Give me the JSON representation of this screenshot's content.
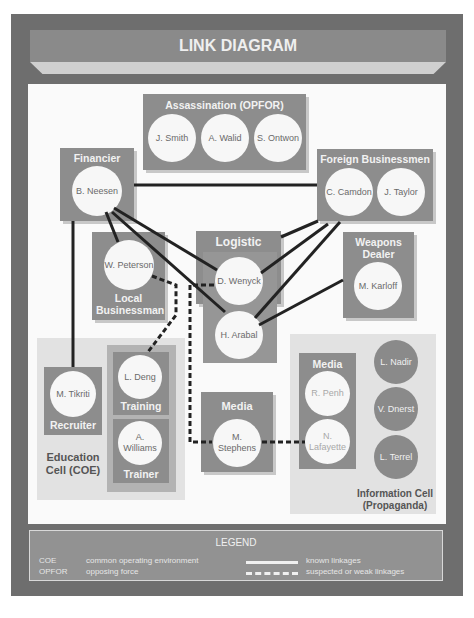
{
  "title": "LINK DIAGRAM",
  "groups": {
    "assassination": {
      "title": "Assassination (OPFOR)",
      "members": [
        "J. Smith",
        "A. Walid",
        "S. Ontwon"
      ]
    },
    "financier": {
      "title": "Financier",
      "members": [
        "B. Neesen"
      ]
    },
    "foreign_businessmen": {
      "title": "Foreign Businessmen",
      "members": [
        "C. Camdon",
        "J. Taylor"
      ]
    },
    "local_businessman": {
      "title": "Local Businessman",
      "members": [
        "W. Peterson"
      ]
    },
    "logistic": {
      "title": "Logistic",
      "members": [
        "D. Wenyck",
        "H. Arabal"
      ]
    },
    "weapons_dealer": {
      "title": "Weapons Dealer",
      "members": [
        "M. Karloff"
      ]
    },
    "recruiter": {
      "title": "Recruiter",
      "members": [
        "M. Tikriti"
      ]
    },
    "training": {
      "title": "Training",
      "members": [
        "L. Deng"
      ]
    },
    "trainer": {
      "title": "Trainer",
      "members": [
        "A. Williams"
      ]
    },
    "media_center": {
      "title": "Media",
      "members": [
        "M. Stephens"
      ]
    },
    "media_info": {
      "title": "Media",
      "members": [
        "R. Penh",
        "N. Lafayette"
      ]
    },
    "info_cell_members": [
      "L. Nadir",
      "V. Dnerst",
      "L. Terrel"
    ]
  },
  "cells": {
    "education": "Education Cell (COE)",
    "information": "Information Cell (Propaganda)"
  },
  "legend": {
    "title": "LEGEND",
    "abbreviations": [
      {
        "abbr": "COE",
        "meaning": "common operating environment"
      },
      {
        "abbr": "OPFOR",
        "meaning": "opposing force"
      }
    ],
    "line_types": [
      {
        "style": "solid",
        "label": "known linkages"
      },
      {
        "style": "dashed",
        "label": "suspected or weak linkages"
      }
    ]
  },
  "links": [
    {
      "from": "B. Neesen",
      "to": "C. Camdon",
      "type": "known"
    },
    {
      "from": "B. Neesen",
      "to": "W. Peterson",
      "type": "known"
    },
    {
      "from": "B. Neesen",
      "to": "D. Wenyck",
      "type": "known"
    },
    {
      "from": "B. Neesen",
      "to": "H. Arabal",
      "type": "known"
    },
    {
      "from": "B. Neesen",
      "to": "M. Tikriti",
      "type": "known"
    },
    {
      "from": "C. Camdon",
      "to": "Logistic",
      "type": "known"
    },
    {
      "from": "C. Camdon",
      "to": "D. Wenyck",
      "type": "known"
    },
    {
      "from": "C. Camdon",
      "to": "H. Arabal",
      "type": "known"
    },
    {
      "from": "M. Karloff",
      "to": "H. Arabal",
      "type": "known"
    },
    {
      "from": "W. Peterson",
      "to": "L. Deng",
      "type": "suspected"
    },
    {
      "from": "D. Wenyck",
      "to": "M. Stephens",
      "type": "suspected"
    },
    {
      "from": "M. Stephens",
      "to": "N. Lafayette",
      "type": "suspected"
    }
  ]
}
